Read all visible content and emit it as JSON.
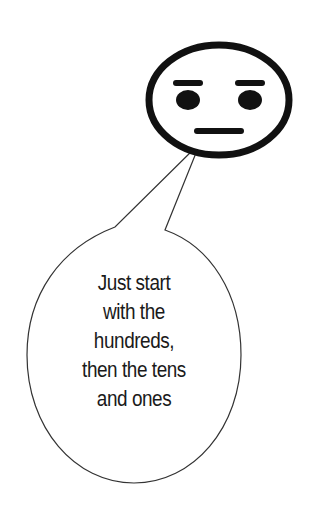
{
  "face": {
    "expression": "neutral-face",
    "stroke_color": "#111111"
  },
  "speech_bubble": {
    "lines": [
      "Just start",
      "with the",
      "hundreds,",
      "then the tens",
      "and ones"
    ],
    "stroke_color": "#333333"
  }
}
